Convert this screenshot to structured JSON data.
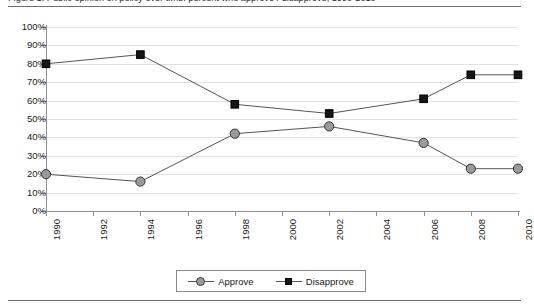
{
  "figure": {
    "caption_clipped": "Figure 1.  Public opinion on policy over time: percent who approve / disapprove, 1990-2010"
  },
  "legend": {
    "position": "bottom-center",
    "entries": [
      {
        "label": "Approve",
        "marker": "circle-marker",
        "color": "#9a9a9a"
      },
      {
        "label": "Disapprove",
        "marker": "square-marker",
        "color": "#161616"
      }
    ]
  },
  "chart_data": {
    "type": "line",
    "title": "",
    "xlabel": "",
    "ylabel": "",
    "x": [
      1990,
      1994,
      1998,
      2002,
      2006,
      2008,
      2010
    ],
    "categories": [
      "1990",
      "1994",
      "1998",
      "2002",
      "2006",
      "2008",
      "2010"
    ],
    "series": [
      {
        "name": "Approve",
        "values": [
          20,
          16,
          42,
          46,
          37,
          23,
          23
        ],
        "color": "#9a9a9a",
        "marker": "circle"
      },
      {
        "name": "Disapprove",
        "values": [
          80,
          85,
          58,
          53,
          61,
          74,
          74
        ],
        "color": "#161616",
        "marker": "square"
      }
    ],
    "xlim": [
      1990,
      2010
    ],
    "ylim": [
      0,
      100
    ],
    "x_tick_values": [
      1990,
      1992,
      1994,
      1996,
      1998,
      2000,
      2002,
      2004,
      2006,
      2008,
      2010
    ],
    "x_tick_labels": [
      "1990",
      "1992",
      "1994",
      "1996",
      "1998",
      "2000",
      "2002",
      "2004",
      "2006",
      "2008",
      "2010"
    ],
    "y_tick_values": [
      0,
      10,
      20,
      30,
      40,
      50,
      60,
      70,
      80,
      90,
      100
    ],
    "y_tick_labels": [
      "0%",
      "10%",
      "20%",
      "30%",
      "40%",
      "50%",
      "60%",
      "70%",
      "80%",
      "90%",
      "100%"
    ],
    "grid": "horizontal",
    "grid_color": "#e2e2e2",
    "axis_color": "#909090",
    "background": "#ffffff"
  }
}
